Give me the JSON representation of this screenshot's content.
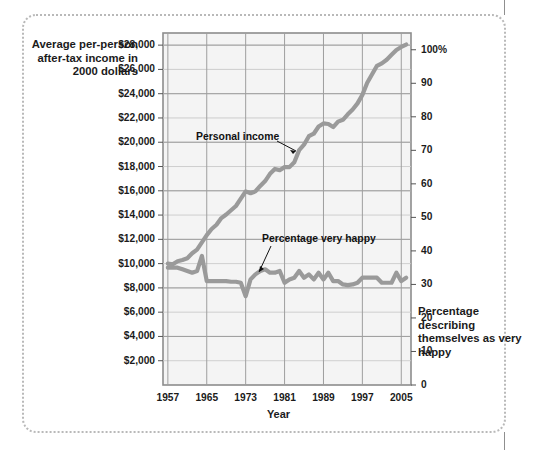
{
  "figure": {
    "left_axis_caption": "Average per-person after-tax income in 2000 dollars",
    "right_axis_caption": "Percentage describing themselves as very happy",
    "x_axis_title": "Year"
  },
  "annotations": {
    "income": "Personal income",
    "happy": "Percentage very happy"
  },
  "chart_data": {
    "type": "line",
    "title": "",
    "subtitle": "",
    "xlabel": "Year",
    "ylabel": "Average per-person after-tax income in 2000 dollars",
    "y2label": "Percentage describing themselves as very happy",
    "grid": true,
    "legend_position": "inline-annotations",
    "xlim": [
      1956,
      2007
    ],
    "ylim": [
      0,
      29000
    ],
    "y2lim": [
      0,
      105
    ],
    "xticks": [
      1957,
      1965,
      1973,
      1981,
      1989,
      1997,
      2005
    ],
    "xticklabels": [
      "1957",
      "1965",
      "1973",
      "1981",
      "1989",
      "1997",
      "2005"
    ],
    "yticks": [
      2000,
      4000,
      6000,
      8000,
      10000,
      12000,
      14000,
      16000,
      18000,
      20000,
      22000,
      24000,
      26000,
      28000
    ],
    "yticklabels": [
      "$2,000",
      "$4,000",
      "$6,000",
      "$8,000",
      "$10,000",
      "$12,000",
      "$14,000",
      "$16,000",
      "$18,000",
      "$20,000",
      "$22,000",
      "$24,000",
      "$26,000",
      "$28,000"
    ],
    "y2ticks": [
      0,
      10,
      20,
      30,
      40,
      50,
      60,
      70,
      80,
      90,
      100
    ],
    "y2ticklabels": [
      "0",
      "10",
      "20",
      "30",
      "40",
      "50",
      "60",
      "70",
      "80",
      "90",
      "100%"
    ],
    "series": [
      {
        "name": "Personal income",
        "axis": "left",
        "color": "#9a9a9a",
        "x": [
          1957,
          1958,
          1959,
          1960,
          1961,
          1962,
          1963,
          1964,
          1965,
          1966,
          1967,
          1968,
          1969,
          1970,
          1971,
          1972,
          1973,
          1974,
          1975,
          1976,
          1977,
          1978,
          1979,
          1980,
          1981,
          1982,
          1983,
          1984,
          1985,
          1986,
          1987,
          1988,
          1989,
          1990,
          1991,
          1992,
          1993,
          1994,
          1995,
          1996,
          1997,
          1998,
          1999,
          2000,
          2001,
          2002,
          2003,
          2004,
          2005,
          2006
        ],
        "values": [
          10000,
          9950,
          10200,
          10300,
          10450,
          10850,
          11150,
          11750,
          12350,
          12850,
          13200,
          13750,
          14050,
          14400,
          14750,
          15350,
          15950,
          15800,
          15950,
          16400,
          16800,
          17400,
          17800,
          17700,
          17950,
          17950,
          18350,
          19350,
          19800,
          20500,
          20700,
          21300,
          21550,
          21500,
          21250,
          21700,
          21850,
          22300,
          22700,
          23200,
          23900,
          24900,
          25600,
          26300,
          26500,
          26800,
          27200,
          27600,
          27850,
          28050
        ]
      },
      {
        "name": "Percentage very happy",
        "axis": "right",
        "color": "#9a9a9a",
        "x": [
          1957,
          1958,
          1959,
          1960,
          1961,
          1962,
          1963,
          1964,
          1965,
          1966,
          1967,
          1968,
          1969,
          1970,
          1971,
          1972,
          1973,
          1974,
          1975,
          1976,
          1977,
          1978,
          1979,
          1980,
          1981,
          1982,
          1983,
          1984,
          1985,
          1986,
          1987,
          1988,
          1989,
          1990,
          1991,
          1992,
          1993,
          1994,
          1995,
          1996,
          1997,
          1998,
          1999,
          2000,
          2001,
          2002,
          2003,
          2004,
          2005,
          2006
        ],
        "values": [
          35,
          35,
          35,
          34.5,
          34,
          33.5,
          34,
          38.5,
          31,
          31,
          31,
          31,
          31,
          30.8,
          30.8,
          30.5,
          26.5,
          31.5,
          33,
          34,
          34.5,
          33.5,
          33.5,
          34,
          30.5,
          31.5,
          32,
          34,
          32,
          33,
          31.5,
          33.5,
          31.5,
          33.5,
          31,
          31,
          30,
          29.8,
          30,
          30.5,
          32,
          32,
          32,
          32,
          30.5,
          30.5,
          30.5,
          33.5,
          31,
          32
        ]
      }
    ]
  }
}
